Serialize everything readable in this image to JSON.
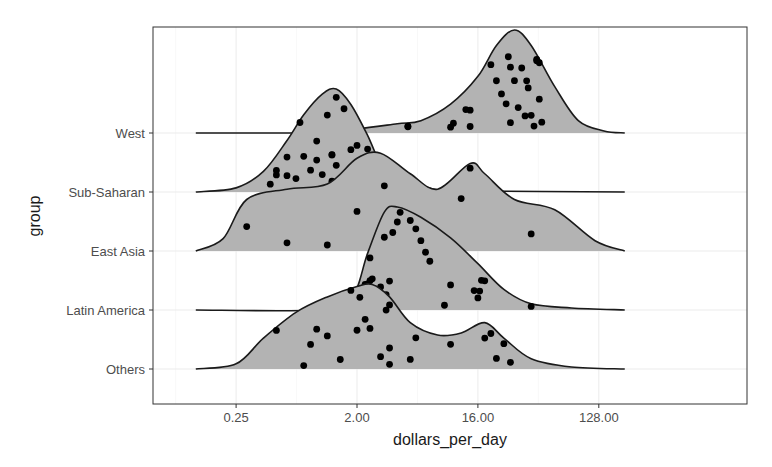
{
  "chart_data": {
    "type": "ridgeline",
    "title": "",
    "xlabel": "dollars_per_day",
    "ylabel": "group",
    "x_scale": "log2",
    "x_ticks": [
      {
        "value": 0.25,
        "label": "0.25"
      },
      {
        "value": 2,
        "label": "2.00"
      },
      {
        "value": 16,
        "label": "16.00"
      },
      {
        "value": 128,
        "label": "128.00"
      }
    ],
    "xlim": [
      0.08,
      260
    ],
    "grid": true,
    "legend": null,
    "fill_color": "#b3b3b3",
    "line_color": "#1a1a1a",
    "point_color": "#000000",
    "categories": [
      "West",
      "Sub-Saharan",
      "East Asia",
      "Latin America",
      "Others"
    ],
    "series": [
      {
        "name": "West",
        "density_curve": [
          [
            0.125,
            0
          ],
          [
            0.5,
            0
          ],
          [
            1,
            0.003
          ],
          [
            2,
            0.04
          ],
          [
            4,
            0.09
          ],
          [
            6,
            0.12
          ],
          [
            10,
            0.28
          ],
          [
            16,
            0.55
          ],
          [
            22,
            0.85
          ],
          [
            30,
            1.0
          ],
          [
            40,
            0.85
          ],
          [
            60,
            0.45
          ],
          [
            90,
            0.12
          ],
          [
            140,
            0.02
          ],
          [
            200,
            0
          ]
        ],
        "points": [
          4.8,
          4.8,
          10,
          10.5,
          14,
          13,
          14,
          20,
          22,
          24,
          26,
          27,
          28,
          28,
          30,
          32,
          34,
          36,
          37,
          38,
          40,
          42,
          44,
          46,
          48,
          46,
          44
        ]
      },
      {
        "name": "Sub-Saharan",
        "density_curve": [
          [
            0.125,
            0
          ],
          [
            0.25,
            0.04
          ],
          [
            0.4,
            0.2
          ],
          [
            0.6,
            0.5
          ],
          [
            0.8,
            0.75
          ],
          [
            1.1,
            0.95
          ],
          [
            1.4,
            1.0
          ],
          [
            1.8,
            0.85
          ],
          [
            2.4,
            0.55
          ],
          [
            3.2,
            0.2
          ],
          [
            4.5,
            0.05
          ],
          [
            6,
            0.06
          ],
          [
            8,
            0.02
          ],
          [
            12,
            0.01
          ],
          [
            200,
            0
          ]
        ],
        "points": [
          0.45,
          0.5,
          0.5,
          0.6,
          0.6,
          0.7,
          0.75,
          0.8,
          0.9,
          1.0,
          1.0,
          1.1,
          1.2,
          1.3,
          1.3,
          1.3,
          1.4,
          1.4,
          1.6,
          1.8,
          1.9,
          2.0,
          2.2,
          2.4,
          2.8,
          6.0,
          6.2
        ]
      },
      {
        "name": "East Asia",
        "density_curve": [
          [
            0.125,
            0
          ],
          [
            0.2,
            0.12
          ],
          [
            0.3,
            0.5
          ],
          [
            0.6,
            0.6
          ],
          [
            1.2,
            0.65
          ],
          [
            2,
            0.9
          ],
          [
            3,
            0.95
          ],
          [
            5,
            0.75
          ],
          [
            8,
            0.6
          ],
          [
            14,
            0.85
          ],
          [
            18,
            0.75
          ],
          [
            30,
            0.5
          ],
          [
            60,
            0.4
          ],
          [
            120,
            0.1
          ],
          [
            200,
            0
          ]
        ],
        "points": [
          0.3,
          0.6,
          1.2,
          2.0,
          3.2,
          12,
          14,
          40
        ]
      },
      {
        "name": "Latin America",
        "density_curve": [
          [
            0.125,
            0
          ],
          [
            1,
            0
          ],
          [
            1.8,
            0.1
          ],
          [
            2.4,
            0.55
          ],
          [
            3.2,
            0.95
          ],
          [
            4,
            1.0
          ],
          [
            6,
            0.9
          ],
          [
            10,
            0.7
          ],
          [
            16,
            0.45
          ],
          [
            25,
            0.2
          ],
          [
            40,
            0.06
          ],
          [
            80,
            0.02
          ],
          [
            200,
            0
          ]
        ],
        "points": [
          2.2,
          2.3,
          2.4,
          2.5,
          2.5,
          2.6,
          2.7,
          3.0,
          3.2,
          3.3,
          3.5,
          3.7,
          4.0,
          4.2,
          5.0,
          5.5,
          6,
          6.5,
          7,
          9,
          10,
          15,
          16,
          16.5,
          17,
          18,
          40
        ]
      },
      {
        "name": "Others",
        "density_curve": [
          [
            0.125,
            0
          ],
          [
            0.25,
            0.05
          ],
          [
            0.4,
            0.3
          ],
          [
            0.7,
            0.55
          ],
          [
            1.2,
            0.7
          ],
          [
            2,
            0.8
          ],
          [
            2.6,
            0.82
          ],
          [
            3.5,
            0.7
          ],
          [
            5,
            0.45
          ],
          [
            8,
            0.33
          ],
          [
            12,
            0.35
          ],
          [
            18,
            0.45
          ],
          [
            25,
            0.3
          ],
          [
            40,
            0.1
          ],
          [
            80,
            0.02
          ],
          [
            200,
            0
          ]
        ],
        "points": [
          0.5,
          0.8,
          0.9,
          1.0,
          1.2,
          1.5,
          1.8,
          2.0,
          2.1,
          2.3,
          2.5,
          3.0,
          3.3,
          3.5,
          3.5,
          3.5,
          5.0,
          5.5,
          10,
          18,
          20,
          22,
          25,
          28
        ]
      }
    ]
  },
  "axes": {
    "x_title": "dollars_per_day",
    "y_title": "group",
    "x_tick_labels": [
      "0.25",
      "2.00",
      "16.00",
      "128.00"
    ],
    "y_tick_labels": [
      "West",
      "Sub-Saharan",
      "East Asia",
      "Latin America",
      "Others"
    ]
  }
}
